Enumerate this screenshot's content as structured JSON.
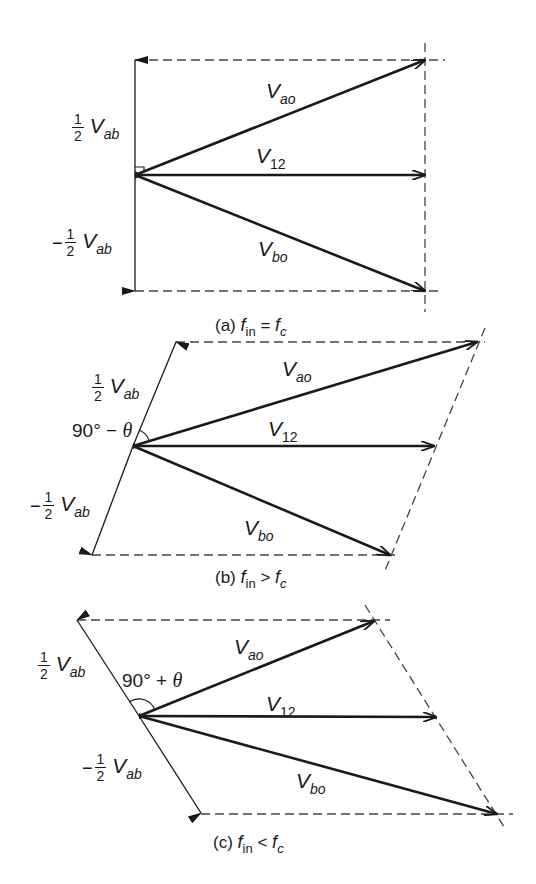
{
  "colors": {
    "stroke": "#1a1a1a",
    "dash": "#444444",
    "background": "#ffffff"
  },
  "diagrams": [
    {
      "id": "a",
      "caption": {
        "prefix": "(a)",
        "lhs": "f",
        "lhs_sub": "in",
        "op": "=",
        "rhs": "f",
        "rhs_sub": "c"
      },
      "origin": [
        135,
        175
      ],
      "half_vab_tip": [
        135,
        60
      ],
      "neg_half_vab_tip": [
        135,
        291
      ],
      "vao_tip": [
        425,
        60
      ],
      "v12_tip": [
        425,
        175
      ],
      "vbo_tip": [
        425,
        291
      ],
      "dashed": [
        [
          [
            135,
            60
          ],
          [
            445,
            60
          ]
        ],
        [
          [
            135,
            291
          ],
          [
            442,
            291
          ]
        ],
        [
          [
            425,
            43
          ],
          [
            425,
            312
          ]
        ]
      ],
      "angle_marker": "right-angle",
      "labels": {
        "half_vab": {
          "num": "1",
          "den": "2",
          "V": "V",
          "sub": "ab",
          "pos": [
            72,
            112
          ]
        },
        "neg_half_vab": {
          "minus": "−",
          "num": "1",
          "den": "2",
          "V": "V",
          "sub": "ab",
          "pos": [
            52,
            227
          ]
        },
        "vao": {
          "V": "V",
          "sub": "ao",
          "pos": [
            266,
            80
          ]
        },
        "v12": {
          "V": "V",
          "sub": "12",
          "pos": [
            256,
            145
          ]
        },
        "vbo": {
          "V": "V",
          "sub": "bo",
          "pos": [
            258,
            238
          ]
        }
      },
      "caption_pos": [
        215,
        316
      ]
    },
    {
      "id": "b",
      "caption": {
        "prefix": "(b)",
        "lhs": "f",
        "lhs_sub": "in",
        "op": ">",
        "rhs": "f",
        "rhs_sub": "c"
      },
      "origin": [
        133,
        446
      ],
      "half_vab_tip": [
        176,
        342
      ],
      "neg_half_vab_tip": [
        92,
        555
      ],
      "vao_tip": [
        477,
        342
      ],
      "v12_tip": [
        434,
        446
      ],
      "vbo_tip": [
        390,
        555
      ],
      "dashed": [
        [
          [
            176,
            342
          ],
          [
            485,
            342
          ]
        ],
        [
          [
            92,
            555
          ],
          [
            397,
            555
          ]
        ],
        [
          [
            485,
            328
          ],
          [
            384,
            573
          ]
        ]
      ],
      "angle_marker": "arc-acute",
      "angle_label": {
        "text": "90° − ",
        "theta": "θ",
        "pos": [
          72,
          420
        ]
      },
      "labels": {
        "half_vab": {
          "num": "1",
          "den": "2",
          "V": "V",
          "sub": "ab",
          "pos": [
            92,
            372
          ]
        },
        "neg_half_vab": {
          "minus": "−",
          "num": "1",
          "den": "2",
          "V": "V",
          "sub": "ab",
          "pos": [
            30,
            490
          ]
        },
        "vao": {
          "V": "V",
          "sub": "ao",
          "pos": [
            282,
            358
          ]
        },
        "v12": {
          "V": "V",
          "sub": "12",
          "pos": [
            268,
            418
          ]
        },
        "vbo": {
          "V": "V",
          "sub": "bo",
          "pos": [
            244,
            517
          ]
        }
      },
      "caption_pos": [
        215,
        568
      ]
    },
    {
      "id": "c",
      "caption": {
        "prefix": "(c)",
        "lhs": "f",
        "lhs_sub": "in",
        "op": "<",
        "rhs": "f",
        "rhs_sub": "c"
      },
      "origin": [
        139,
        716
      ],
      "half_vab_tip": [
        77,
        620
      ],
      "neg_half_vab_tip": [
        201,
        813
      ],
      "vao_tip": [
        374,
        621
      ],
      "v12_tip": [
        436,
        717
      ],
      "vbo_tip": [
        497,
        814
      ],
      "dashed": [
        [
          [
            77,
            620
          ],
          [
            390,
            620
          ]
        ],
        [
          [
            201,
            814
          ],
          [
            513,
            814
          ]
        ],
        [
          [
            365,
            605
          ],
          [
            506,
            830
          ]
        ]
      ],
      "angle_marker": "arc-obtuse",
      "angle_label": {
        "text": "90° + ",
        "theta": "θ",
        "pos": [
          122,
          670
        ]
      },
      "labels": {
        "half_vab": {
          "num": "1",
          "den": "2",
          "V": "V",
          "sub": "ab",
          "pos": [
            38,
            650
          ]
        },
        "neg_half_vab": {
          "minus": "−",
          "num": "1",
          "den": "2",
          "V": "V",
          "sub": "ab",
          "pos": [
            82,
            752
          ]
        },
        "vao": {
          "V": "V",
          "sub": "ao",
          "pos": [
            234,
            636
          ]
        },
        "v12": {
          "V": "V",
          "sub": "12",
          "pos": [
            266,
            693
          ]
        },
        "vbo": {
          "V": "V",
          "sub": "bo",
          "pos": [
            296,
            770
          ]
        }
      },
      "caption_pos": [
        213,
        833
      ]
    }
  ]
}
